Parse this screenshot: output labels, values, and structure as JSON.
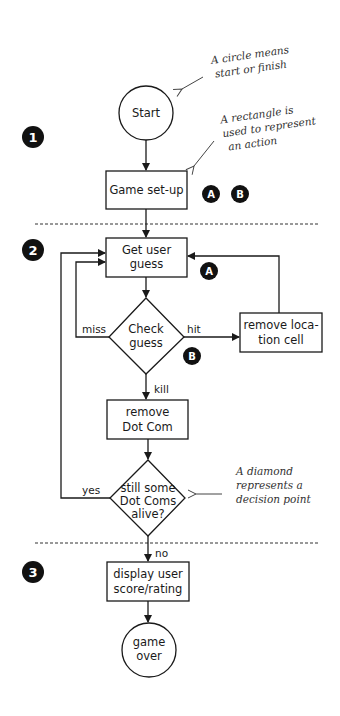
{
  "sections": [
    {
      "number": "1",
      "badge_x": 33,
      "badge_y": 137
    },
    {
      "number": "2",
      "badge_x": 33,
      "badge_y": 250
    },
    {
      "number": "3",
      "badge_x": 33,
      "badge_y": 572
    }
  ],
  "nodes": {
    "start": {
      "shape": "circle",
      "lines": [
        "Start"
      ]
    },
    "game_setup": {
      "shape": "rectangle",
      "lines": [
        "Game set-up"
      ]
    },
    "get_user_guess": {
      "shape": "rectangle",
      "lines": [
        "Get user",
        "guess"
      ]
    },
    "check_guess": {
      "shape": "diamond",
      "lines": [
        "Check",
        "guess"
      ]
    },
    "remove_location_cell": {
      "shape": "rectangle",
      "lines": [
        "remove loca-",
        "tion cell"
      ]
    },
    "remove_dot_com": {
      "shape": "rectangle",
      "lines": [
        "remove",
        "Dot Com"
      ]
    },
    "still_alive": {
      "shape": "diamond",
      "lines": [
        "still some",
        "Dot Coms",
        "alive?"
      ]
    },
    "display_score": {
      "shape": "rectangle",
      "lines": [
        "display user",
        "score/rating"
      ]
    },
    "game_over": {
      "shape": "circle",
      "lines": [
        "game",
        "over"
      ]
    }
  },
  "edges": {
    "miss": "miss",
    "hit": "hit",
    "kill": "kill",
    "yes": "yes",
    "no": "no"
  },
  "markers": {
    "a": "A",
    "b": "B"
  },
  "annotations": {
    "circle": [
      "A circle means",
      "start or finish"
    ],
    "rectangle": [
      "A rectangle is",
      "used to represent",
      "an action"
    ],
    "diamond": [
      "A diamond",
      "represents a",
      "decision point"
    ]
  }
}
